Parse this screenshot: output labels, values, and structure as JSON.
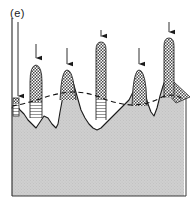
{
  "figure": {
    "panel_label": "(e)",
    "colors": {
      "bulk_fill": "#c9c9c9",
      "outline": "#1a1a1a",
      "frame": "#444444",
      "checker_dark": "#555555",
      "checker_light": "#ffffff",
      "hatch_line": "#777777",
      "arrow": "#1a1a1a",
      "dashed_line": "#111111",
      "background": "#ffffff"
    },
    "frame": {
      "left": 12,
      "right": 184,
      "bottom": 196,
      "top": 14
    },
    "dashed_reference_line": {
      "style": "dashed",
      "points": "12,106 26,103 44,99 62,93 82,92 100,97 118,103 134,104 150,100 166,95 180,99 184,101"
    },
    "surface_profile": {
      "points": "12,108 16,104 20,110 24,114 28,120 32,124 36,128 40,122 44,116 48,118 52,124 56,128 58,124 60,112 63,96 66,84 69,78 73,82 77,96 81,110 85,118 89,124 93,128 97,130 101,128 105,124 109,120 113,116 117,112 121,108 125,104 129,100 133,92 136,84 139,80 142,84 145,94 148,104 151,112 154,116 157,108 160,96 163,86 166,78 169,72 172,78 175,86 178,92 181,96 184,98"
    },
    "arrows": [
      {
        "id": "arrow-1",
        "x": 18,
        "y_start": 22,
        "y_end": 100,
        "length": 78
      },
      {
        "id": "arrow-2",
        "x": 36,
        "y_start": 44,
        "y_end": 62,
        "length": 18
      },
      {
        "id": "arrow-3",
        "x": 67,
        "y_start": 48,
        "y_end": 68,
        "length": 20
      },
      {
        "id": "arrow-4",
        "x": 101,
        "y_start": 38,
        "y_end": 58,
        "length": 20
      },
      {
        "id": "arrow-5",
        "x": 139,
        "y_start": 48,
        "y_end": 68,
        "length": 20
      },
      {
        "id": "arrow-6",
        "x": 169,
        "y_start": 26,
        "y_end": 46,
        "length": 20
      }
    ],
    "columns": [
      {
        "id": "column-1",
        "x_left": 13,
        "x_right": 19,
        "top": 100,
        "bottom": 114,
        "checker_until": 104,
        "pattern_top": "checker",
        "pattern_bottom": "hlines"
      },
      {
        "id": "column-2",
        "x_left": 28,
        "x_right": 44,
        "top": 65,
        "bottom": 118,
        "checker_until": 102,
        "pattern_top": "checker",
        "pattern_bottom": "hlines"
      },
      {
        "id": "column-3",
        "x_left": 59,
        "x_right": 76,
        "top": 70,
        "bottom": 99,
        "checker_until": 99,
        "pattern_top": "checker",
        "pattern_bottom": "none"
      },
      {
        "id": "column-4",
        "x_left": 95,
        "x_right": 108,
        "top": 42,
        "bottom": 120,
        "checker_until": 99,
        "pattern_top": "checker",
        "pattern_bottom": "hlines"
      },
      {
        "id": "column-5",
        "x_left": 131,
        "x_right": 147,
        "top": 70,
        "bottom": 105,
        "checker_until": 105,
        "pattern_top": "checker",
        "pattern_bottom": "none"
      },
      {
        "id": "column-6",
        "x_left": 163,
        "x_right": 176,
        "top": 38,
        "bottom": 96,
        "checker_until": 96,
        "pattern_top": "checker",
        "pattern_bottom": "none"
      }
    ],
    "checker_wedges": [
      {
        "id": "wedge-right",
        "points": "176,84 190,96 176,102 168,94"
      }
    ]
  }
}
